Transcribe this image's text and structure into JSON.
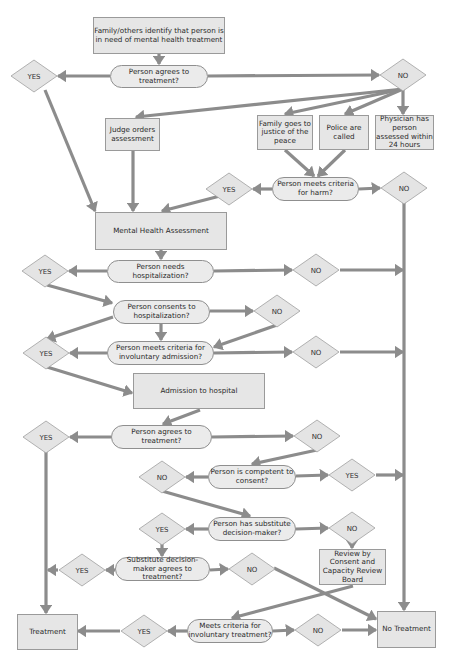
{
  "colors": {
    "box_fill": "#e6e6e6",
    "box_border": "#9a9a9a",
    "pill_fill": "#ebebeb",
    "diamond_fill": "#e4e4e4",
    "diamond_border": "#a0a0a0",
    "arrow": "#8c8c8c",
    "text": "#2a2a2a"
  },
  "nodes": {
    "start": {
      "label": "Family/others identify that person is in need of mental health treatment",
      "x": 93,
      "y": 17,
      "w": 132,
      "h": 37,
      "type": "box"
    },
    "q_agrees_1": {
      "label": "Person agrees to treatment?",
      "x": 110,
      "y": 65,
      "w": 98,
      "h": 23,
      "type": "pill"
    },
    "judge": {
      "label": "Judge orders assessment",
      "x": 105,
      "y": 118,
      "w": 55,
      "h": 33,
      "type": "box"
    },
    "family_jp": {
      "label": "Family goes to justice of the peace",
      "x": 257,
      "y": 115,
      "w": 56,
      "h": 35,
      "type": "box"
    },
    "police": {
      "label": "Police are called",
      "x": 319,
      "y": 115,
      "w": 50,
      "h": 35,
      "type": "box"
    },
    "physician": {
      "label": "Physician has person assessed within 24 hours",
      "x": 375,
      "y": 115,
      "w": 59,
      "h": 35,
      "type": "box"
    },
    "q_harm": {
      "label": "Person meets criteria for harm?",
      "x": 272,
      "y": 177,
      "w": 87,
      "h": 24,
      "type": "pill"
    },
    "mha": {
      "label": "Mental Health Assessment",
      "x": 95,
      "y": 212,
      "w": 132,
      "h": 38,
      "type": "box"
    },
    "q_needs_hosp": {
      "label": "Person needs hospitalization?",
      "x": 107,
      "y": 260,
      "w": 107,
      "h": 23,
      "type": "pill"
    },
    "q_consents_hosp": {
      "label": "Person consents to hospitalization?",
      "x": 113,
      "y": 300,
      "w": 97,
      "h": 24,
      "type": "pill"
    },
    "q_invol_admission": {
      "label": "Person meets criteria for involuntary admission?",
      "x": 107,
      "y": 341,
      "w": 107,
      "h": 24,
      "type": "pill"
    },
    "admission": {
      "label": "Admission to hospital",
      "x": 133,
      "y": 373,
      "w": 132,
      "h": 36,
      "type": "box"
    },
    "q_agrees_2": {
      "label": "Person agrees to treatment?",
      "x": 111,
      "y": 425,
      "w": 101,
      "h": 24,
      "type": "pill"
    },
    "q_competent": {
      "label": "Person is competent to consent?",
      "x": 208,
      "y": 465,
      "w": 88,
      "h": 24,
      "type": "pill"
    },
    "q_substitute": {
      "label": "Person has substitute decision-maker?",
      "x": 208,
      "y": 517,
      "w": 88,
      "h": 24,
      "type": "pill"
    },
    "review_board": {
      "label": "Review by Consent and Capacity Review Board",
      "x": 319,
      "y": 549,
      "w": 67,
      "h": 36,
      "type": "box"
    },
    "q_sdm_agrees": {
      "label": "Substitute decision-maker agrees to treatment?",
      "x": 115,
      "y": 557,
      "w": 95,
      "h": 24,
      "type": "pill"
    },
    "treatment": {
      "label": "Treatment",
      "x": 17,
      "y": 614,
      "w": 61,
      "h": 36,
      "type": "box"
    },
    "q_invol_treatment": {
      "label": "Meets criteria for involuntary treatment?",
      "x": 187,
      "y": 619,
      "w": 86,
      "h": 24,
      "type": "pill"
    },
    "no_treatment": {
      "label": "No Treatment",
      "x": 377,
      "y": 611,
      "w": 59,
      "h": 37,
      "type": "box"
    }
  },
  "diamonds": [
    {
      "id": "yes_1",
      "label": "YES",
      "cx": 34,
      "cy": 76
    },
    {
      "id": "no_1",
      "label": "NO",
      "cx": 403,
      "cy": 75
    },
    {
      "id": "yes_harm",
      "label": "YES",
      "cx": 229,
      "cy": 189
    },
    {
      "id": "no_harm",
      "label": "NO",
      "cx": 404,
      "cy": 188
    },
    {
      "id": "yes_needs_hosp",
      "label": "YES",
      "cx": 45,
      "cy": 271
    },
    {
      "id": "no_needs_hosp",
      "label": "NO",
      "cx": 316,
      "cy": 270
    },
    {
      "id": "no_consents_hosp",
      "label": "NO",
      "cx": 277,
      "cy": 311
    },
    {
      "id": "yes_invol_admission",
      "label": "YES",
      "cx": 46,
      "cy": 353
    },
    {
      "id": "no_invol_admission",
      "label": "NO",
      "cx": 316,
      "cy": 352
    },
    {
      "id": "yes_agrees_2",
      "label": "YES",
      "cx": 46,
      "cy": 437
    },
    {
      "id": "no_agrees_2",
      "label": "NO",
      "cx": 317,
      "cy": 436
    },
    {
      "id": "no_competent",
      "label": "NO",
      "cx": 162,
      "cy": 477
    },
    {
      "id": "yes_competent",
      "label": "YES",
      "cx": 352,
      "cy": 475
    },
    {
      "id": "yes_substitute",
      "label": "YES",
      "cx": 162,
      "cy": 529
    },
    {
      "id": "no_substitute",
      "label": "NO",
      "cx": 352,
      "cy": 528
    },
    {
      "id": "yes_sdm",
      "label": "YES",
      "cx": 82,
      "cy": 570
    },
    {
      "id": "no_sdm",
      "label": "NO",
      "cx": 252,
      "cy": 569
    },
    {
      "id": "yes_invol_treatment",
      "label": "YES",
      "cx": 144,
      "cy": 631
    },
    {
      "id": "no_invol_treatment",
      "label": "NO",
      "cx": 318,
      "cy": 630
    }
  ],
  "edges": [
    [
      [
        159,
        54
      ],
      [
        159,
        64
      ]
    ],
    [
      [
        110,
        76
      ],
      [
        58,
        76
      ]
    ],
    [
      [
        208,
        76
      ],
      [
        379,
        75
      ]
    ],
    [
      [
        45,
        90
      ],
      [
        95,
        211
      ]
    ],
    [
      [
        403,
        89
      ],
      [
        136,
        117
      ]
    ],
    [
      [
        403,
        89
      ],
      [
        285,
        114
      ]
    ],
    [
      [
        403,
        89
      ],
      [
        345,
        114
      ]
    ],
    [
      [
        403,
        89
      ],
      [
        403,
        114
      ]
    ],
    [
      [
        133,
        151
      ],
      [
        133,
        211
      ]
    ],
    [
      [
        285,
        150
      ],
      [
        314,
        176
      ]
    ],
    [
      [
        345,
        150
      ],
      [
        318,
        176
      ]
    ],
    [
      [
        272,
        189
      ],
      [
        253,
        189
      ]
    ],
    [
      [
        220,
        196
      ],
      [
        162,
        211
      ]
    ],
    [
      [
        359,
        189
      ],
      [
        380,
        188
      ]
    ],
    [
      [
        404,
        202
      ],
      [
        404,
        610
      ]
    ],
    [
      [
        161,
        250
      ],
      [
        161,
        259
      ]
    ],
    [
      [
        107,
        271
      ],
      [
        69,
        271
      ]
    ],
    [
      [
        214,
        271
      ],
      [
        292,
        270
      ]
    ],
    [
      [
        340,
        270
      ],
      [
        403,
        270
      ]
    ],
    [
      [
        47,
        285
      ],
      [
        112,
        303
      ]
    ],
    [
      [
        210,
        311
      ],
      [
        253,
        311
      ]
    ],
    [
      [
        161,
        324
      ],
      [
        161,
        340
      ]
    ],
    [
      [
        277,
        325
      ],
      [
        214,
        347
      ]
    ],
    [
      [
        113,
        317
      ],
      [
        47,
        339
      ]
    ],
    [
      [
        107,
        353
      ],
      [
        70,
        353
      ]
    ],
    [
      [
        214,
        353
      ],
      [
        292,
        352
      ]
    ],
    [
      [
        340,
        352
      ],
      [
        403,
        352
      ]
    ],
    [
      [
        47,
        367
      ],
      [
        132,
        393
      ]
    ],
    [
      [
        200,
        410
      ],
      [
        163,
        424
      ]
    ],
    [
      [
        111,
        437
      ],
      [
        70,
        437
      ]
    ],
    [
      [
        212,
        437
      ],
      [
        293,
        436
      ]
    ],
    [
      [
        317,
        450
      ],
      [
        252,
        464
      ]
    ],
    [
      [
        46,
        451
      ],
      [
        46,
        613
      ]
    ],
    [
      [
        208,
        477
      ],
      [
        186,
        477
      ]
    ],
    [
      [
        296,
        476
      ],
      [
        328,
        475
      ]
    ],
    [
      [
        376,
        475
      ],
      [
        403,
        475
      ]
    ],
    [
      [
        162,
        491
      ],
      [
        250,
        516
      ]
    ],
    [
      [
        208,
        529
      ],
      [
        186,
        529
      ]
    ],
    [
      [
        296,
        529
      ],
      [
        328,
        528
      ]
    ],
    [
      [
        352,
        542
      ],
      [
        352,
        548
      ]
    ],
    [
      [
        162,
        543
      ],
      [
        162,
        556
      ]
    ],
    [
      [
        115,
        570
      ],
      [
        106,
        570
      ]
    ],
    [
      [
        58,
        570
      ],
      [
        48,
        570
      ]
    ],
    [
      [
        210,
        570
      ],
      [
        228,
        569
      ]
    ],
    [
      [
        274,
        568
      ],
      [
        376,
        619
      ]
    ],
    [
      [
        353,
        586
      ],
      [
        232,
        618
      ]
    ],
    [
      [
        187,
        631
      ],
      [
        168,
        631
      ]
    ],
    [
      [
        120,
        631
      ],
      [
        78,
        631
      ]
    ],
    [
      [
        273,
        631
      ],
      [
        294,
        630
      ]
    ],
    [
      [
        342,
        630
      ],
      [
        376,
        630
      ]
    ]
  ]
}
